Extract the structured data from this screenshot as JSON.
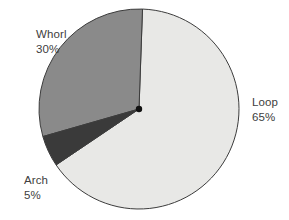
{
  "chart_data": {
    "type": "pie",
    "title": "",
    "subtitle": "",
    "xlabel": "",
    "ylabel": "",
    "legend_position": "none",
    "grid": false,
    "labels_outside": true,
    "total": 100,
    "units": "%",
    "categories": [
      "Loop",
      "Whorl",
      "Arch"
    ],
    "values": [
      65,
      30,
      5
    ],
    "slices": [
      {
        "name": "Loop",
        "value": 65,
        "value_label": "65%",
        "color": "#e8e8e6",
        "start_angle": -88,
        "end_angle": 146,
        "label_x": 252,
        "label_y": 106
      },
      {
        "name": "Whorl",
        "value": 30,
        "value_label": "30%",
        "color": "#8a8a8a",
        "start_angle": -88,
        "end_angle": -196,
        "label_x": 36,
        "label_y": 38
      },
      {
        "name": "Arch",
        "value": 5,
        "value_label": "5%",
        "color": "#3a3a3a",
        "start_angle": 146,
        "end_angle": 164,
        "label_x": 24,
        "label_y": 184
      }
    ],
    "geometry": {
      "center_x": 139,
      "center_y": 109,
      "radius": 100
    },
    "style": {
      "background": "#ffffff",
      "outline": "#3c3c3c",
      "label_color": "#404040",
      "center_dot": "#111111"
    }
  }
}
